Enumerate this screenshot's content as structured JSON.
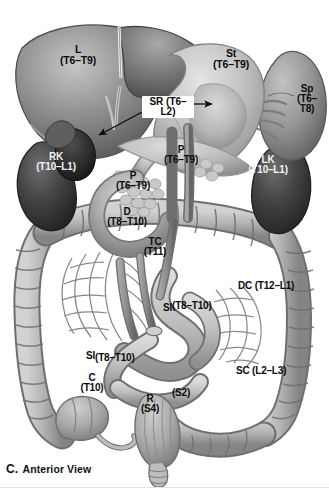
{
  "figure": {
    "caption_letter": "C.",
    "caption_text": "Anterior View",
    "view": "Anterior View",
    "modality": "grayscale anatomical illustration",
    "width": 329,
    "height": 492,
    "background_color": "#ffffff"
  },
  "palette": {
    "background": "#ffffff",
    "label_dark": "#0b0b0b",
    "label_light": "#f2f2f2",
    "callout_fill": "#ffffff",
    "liver_mid": "#8d8d8d",
    "liver_dark": "#5c5c5c",
    "stomach_light": "#c9c9c9",
    "pancreas_light": "#cfcfcf",
    "kidney_dark": "#3a3a3a",
    "spleen_mid": "#9a9a9a",
    "bowel_mid": "#b4b4b4",
    "bowel_shadow": "#7f7f7f",
    "vessel_gray": "#8a8a8a",
    "rectum_mid": "#a8a8a8"
  },
  "labels": [
    {
      "id": "liver",
      "name": "L",
      "organ": "Liver",
      "levels": "(T6–T9)",
      "x": 69,
      "y": 48,
      "font_size": 10.5,
      "tone": "light",
      "layout": "stacked"
    },
    {
      "id": "stomach",
      "name": "St",
      "organ": "Stomach",
      "levels": "(T6–T9)",
      "x": 229,
      "y": 53,
      "font_size": 10.5,
      "tone": "light",
      "layout": "stacked"
    },
    {
      "id": "spleen",
      "name": "Sp",
      "organ": "Spleen",
      "levels": "(T6– T8)",
      "levels_line1": "(T6–",
      "levels_line2": "T8)",
      "x": 305,
      "y": 89,
      "font_size": 10,
      "tone": "light",
      "layout": "stacked-three"
    },
    {
      "id": "suprarenal",
      "name": "SR",
      "organ": "Suprarenal (adrenal) glands",
      "levels": "(T6–L2)",
      "x": 163,
      "y": 102,
      "font_size": 10,
      "tone": "callout",
      "layout": "callout",
      "has_arrows": true,
      "arrow_left_to": [
        98,
        134
      ],
      "arrow_right_to": [
        213,
        107
      ]
    },
    {
      "id": "right-kidney",
      "name": "RK",
      "organ": "Right kidney",
      "levels": "(T10–L1)",
      "x": 56,
      "y": 157,
      "font_size": 10,
      "tone": "dark",
      "layout": "stacked"
    },
    {
      "id": "left-kidney",
      "name": "LK",
      "organ": "Left kidney",
      "levels": "(T10–L1)",
      "x": 268,
      "y": 160,
      "font_size": 10,
      "tone": "dark",
      "layout": "stacked"
    },
    {
      "id": "pancreas-body",
      "name": "P",
      "organ": "Pancreas",
      "levels": "(T6–T9)",
      "x": 181,
      "y": 150,
      "font_size": 10,
      "tone": "light",
      "layout": "stacked"
    },
    {
      "id": "pancreas-head",
      "name": "P",
      "organ": "Pancreas (head)",
      "levels": "(T6–T9)",
      "x": 133,
      "y": 176,
      "font_size": 10,
      "tone": "light",
      "layout": "stacked"
    },
    {
      "id": "duodenum",
      "name": "D",
      "organ": "Duodenum",
      "levels": "(T8–T10)",
      "x": 127,
      "y": 212,
      "font_size": 10,
      "tone": "light",
      "layout": "stacked"
    },
    {
      "id": "transverse-colon",
      "name": "TC",
      "organ": "Transverse colon",
      "levels": "(T11)",
      "x": 155,
      "y": 242,
      "font_size": 10,
      "tone": "light",
      "layout": "stacked"
    },
    {
      "id": "descending-colon",
      "name": "DC",
      "organ": "Descending colon",
      "levels": "(T12–L1)",
      "x": 281,
      "y": 287,
      "font_size": 10,
      "tone": "light",
      "layout": "inline"
    },
    {
      "id": "small-intestine-upper",
      "name": "SI",
      "organ": "Small intestine",
      "levels": "(T8–T10)",
      "x": 198,
      "y": 307,
      "font_size": 10,
      "tone": "light",
      "layout": "inline-drop"
    },
    {
      "id": "small-intestine-lower",
      "name": "SI",
      "organ": "Small intestine",
      "levels": "(T8–T10)",
      "x": 122,
      "y": 360,
      "font_size": 10,
      "tone": "light",
      "layout": "inline-raise"
    },
    {
      "id": "sigmoid-colon",
      "name": "SC",
      "organ": "Sigmoid colon",
      "levels": "(L2–L3)",
      "x": 278,
      "y": 372,
      "font_size": 10,
      "tone": "light",
      "layout": "inline"
    },
    {
      "id": "sigmoid-s2",
      "name": "",
      "organ": "Sigmoid colon (S2)",
      "levels": "(S2)",
      "x": 180,
      "y": 394,
      "font_size": 10,
      "tone": "light",
      "layout": "levels-only"
    },
    {
      "id": "rectum",
      "name": "R",
      "organ": "Rectum",
      "levels": "(S4)",
      "x": 150,
      "y": 399,
      "font_size": 10,
      "tone": "light",
      "layout": "stacked"
    },
    {
      "id": "cecum",
      "name": "C",
      "organ": "Cecum",
      "levels": "(T10)",
      "x": 91,
      "y": 378,
      "font_size": 10,
      "tone": "light",
      "layout": "stacked"
    }
  ]
}
